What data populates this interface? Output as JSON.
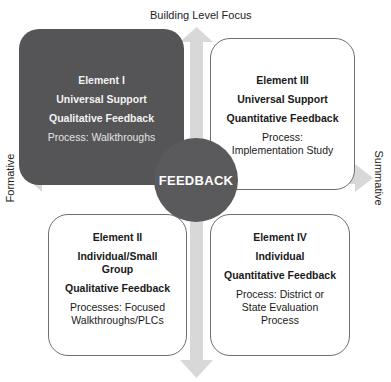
{
  "axes": {
    "top": "Building Level Focus",
    "left": "Formative",
    "right": "Summative"
  },
  "center": {
    "label": "FEEDBACK"
  },
  "elements": [
    {
      "id": "I",
      "title": "Element I",
      "line1": "Universal Support",
      "line2": "Qualitative Feedback",
      "process": "Process: Walkthroughs"
    },
    {
      "id": "III",
      "title": "Element III",
      "line1": "Universal Support",
      "line2": "Quantitative Feedback",
      "process_a": "Process:",
      "process_b": "Implementation Study"
    },
    {
      "id": "II",
      "title": "Element II",
      "line1a": "Individual/Small",
      "line1b": "Group",
      "line2": "Qualitative Feedback",
      "process_a": "Processes: Focused",
      "process_b": "Walkthroughs/PLCs"
    },
    {
      "id": "IV",
      "title": "Element IV",
      "line1": "Individual",
      "line2": "Quantitative Feedback",
      "process_a": "Process: District or",
      "process_b": "State Evaluation",
      "process_c": "Process"
    }
  ],
  "colors": {
    "dark_box": "#555457",
    "circle": "#5a595c",
    "arrow": "#d6d6d6",
    "border": "#6e6e6e"
  }
}
